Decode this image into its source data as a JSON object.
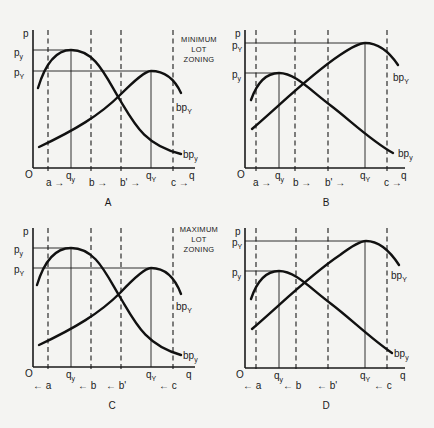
{
  "figure": {
    "panels": [
      {
        "id": "A",
        "label": "A",
        "annotation": [
          "MINIMUM",
          "LOT",
          "ZONING"
        ],
        "y_axis_label": "p",
        "x_axis_label": "q",
        "origin_label": "O",
        "price_labels": [
          {
            "base": "p",
            "sub": "y"
          },
          {
            "base": "p",
            "sub": "Y"
          }
        ],
        "quantity_labels": [
          {
            "base": "q",
            "sub": "y"
          },
          {
            "base": "q",
            "sub": "Y"
          }
        ],
        "curve_labels": [
          {
            "base": "bp",
            "sub": "Y"
          },
          {
            "base": "bp",
            "sub": "y"
          }
        ],
        "boundary_labels": [
          "a →",
          "b →",
          "b' →",
          "c →"
        ]
      },
      {
        "id": "B",
        "label": "B",
        "y_axis_label": "p",
        "x_axis_label": "q",
        "origin_label": "O",
        "price_labels": [
          {
            "base": "p",
            "sub": "Y"
          },
          {
            "base": "p",
            "sub": "y"
          }
        ],
        "quantity_labels": [
          {
            "base": "q",
            "sub": "y"
          },
          {
            "base": "q",
            "sub": "Y"
          }
        ],
        "curve_labels": [
          {
            "base": "bp",
            "sub": "Y"
          },
          {
            "base": "bp",
            "sub": "y"
          }
        ],
        "boundary_labels": [
          "a →",
          "b →",
          "b' →",
          "c →"
        ]
      },
      {
        "id": "C",
        "label": "C",
        "annotation": [
          "MAXIMUM",
          "LOT",
          "ZONING"
        ],
        "y_axis_label": "p",
        "x_axis_label": "q",
        "origin_label": "O",
        "price_labels": [
          {
            "base": "p",
            "sub": "y"
          },
          {
            "base": "p",
            "sub": "Y"
          }
        ],
        "quantity_labels": [
          {
            "base": "q",
            "sub": "y"
          },
          {
            "base": "q",
            "sub": "Y"
          }
        ],
        "curve_labels": [
          {
            "base": "bp",
            "sub": "Y"
          },
          {
            "base": "bp",
            "sub": "y"
          }
        ],
        "boundary_labels": [
          "← a",
          "← b",
          "← b'",
          "← c"
        ]
      },
      {
        "id": "D",
        "label": "D",
        "y_axis_label": "p",
        "x_axis_label": "q",
        "origin_label": "O",
        "price_labels": [
          {
            "base": "p",
            "sub": "Y"
          },
          {
            "base": "p",
            "sub": "y"
          }
        ],
        "quantity_labels": [
          {
            "base": "q",
            "sub": "y"
          },
          {
            "base": "q",
            "sub": "Y"
          }
        ],
        "curve_labels": [
          {
            "base": "bp",
            "sub": "Y"
          },
          {
            "base": "bp",
            "sub": "y"
          }
        ],
        "boundary_labels": [
          "← a",
          "← b",
          "← b'",
          "← c"
        ]
      }
    ]
  }
}
